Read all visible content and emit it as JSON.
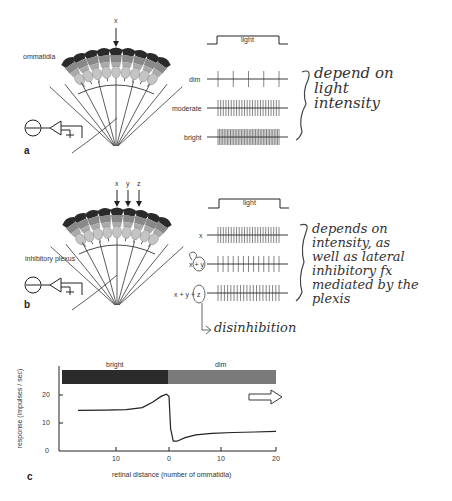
{
  "panel_a": {
    "letter": "a",
    "stimulus_labels": [
      "x"
    ],
    "ommatidia_label": "ommatidia",
    "light_label": "light",
    "rows": [
      {
        "label": "dim",
        "spikes": 5
      },
      {
        "label": "moderate",
        "spikes": 24
      },
      {
        "label": "bright",
        "spikes": 40
      }
    ],
    "note_lines": [
      "depend on",
      "light",
      "intensity"
    ]
  },
  "panel_b": {
    "letter": "b",
    "stimulus_labels": [
      "x",
      "y",
      "z"
    ],
    "plexus_label": "inhibitory plexus",
    "light_label": "light",
    "rows": [
      {
        "label": "x",
        "spikes": 24
      },
      {
        "label": "x + y",
        "spikes": 13
      },
      {
        "label": "x + y + z",
        "spikes": 20
      }
    ],
    "note_lines": [
      "depends on",
      "intensity, as",
      "well as lateral",
      "inhibitory fx",
      "mediated by the",
      "plexis"
    ],
    "disinhibition_note": "disinhibition"
  },
  "panel_c": {
    "letter": "c",
    "bar_labels": {
      "left": "bright",
      "right": "dim"
    },
    "colors": {
      "bright": "#2b2b2b",
      "dim": "#7a7a7a",
      "line": "#222222"
    }
  },
  "chart_data": {
    "type": "line",
    "title": "",
    "xlabel": "retinal distance (number of ommatidia)",
    "ylabel": "response (impulses / sec)",
    "x_ticks": [
      "10",
      "0",
      "10",
      "20"
    ],
    "y_ticks": [
      "0",
      "10",
      "20"
    ],
    "ylim": [
      0,
      28
    ],
    "xlim": [
      -20,
      20
    ],
    "grid": false,
    "annotations": [
      "bright",
      "dim",
      "right arrow"
    ],
    "series": [
      {
        "name": "response",
        "x": [
          -17,
          -12,
          -8,
          -5,
          -3,
          -1.5,
          -0.5,
          0,
          0.3,
          0.8,
          1.5,
          3,
          5,
          8,
          12,
          16,
          20
        ],
        "values": [
          14.5,
          14.6,
          14.8,
          15.5,
          17.5,
          19.5,
          20.3,
          19.5,
          8,
          3.5,
          3.5,
          4.8,
          5.8,
          6.3,
          6.6,
          6.8,
          7
        ]
      }
    ]
  }
}
